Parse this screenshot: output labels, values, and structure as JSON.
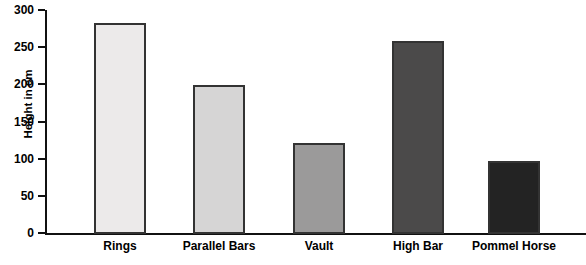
{
  "chart_data": {
    "type": "bar",
    "title": "",
    "xlabel": "",
    "ylabel": "Height in cm",
    "ylim": [
      0,
      300
    ],
    "yticks": [
      0,
      50,
      100,
      150,
      200,
      250,
      300
    ],
    "ytick_labels": [
      "0",
      "50",
      "100",
      "150",
      "200",
      "250",
      "300"
    ],
    "grid": false,
    "legend": "none",
    "categories": [
      "Rings",
      "Parallel Bars",
      "Vault",
      "High Bar",
      "Pommel Horse"
    ],
    "values": [
      284,
      200,
      122,
      260,
      98
    ],
    "bar_colors": [
      "#eceaea",
      "#d6d5d5",
      "#9b9a9a",
      "#4b4a4a",
      "#232323"
    ],
    "bar_edge_color": "#333333",
    "axis_color": "#111111",
    "background_color": "#ffffff"
  },
  "axis": {
    "y_title": "Height in cm"
  }
}
